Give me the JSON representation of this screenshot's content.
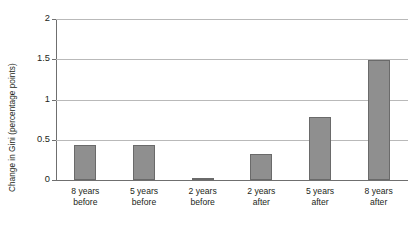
{
  "chart_data": {
    "type": "bar",
    "title": "",
    "xlabel": "",
    "ylabel": "Change in Gini (percentage points)",
    "ylim": [
      0,
      2
    ],
    "yticks": [
      "0",
      "0.5",
      "1",
      "1.5",
      "2"
    ],
    "ytick_values": [
      0,
      0.5,
      1,
      1.5,
      2
    ],
    "grid": true,
    "legend": "none",
    "categories": [
      "8 years before",
      "5 years before",
      "2 years before",
      "2 years after",
      "5 years after",
      "8 years after"
    ],
    "category_lines": [
      {
        "line1": "8 years",
        "line2": "before"
      },
      {
        "line1": "5 years",
        "line2": "before"
      },
      {
        "line1": "2 years",
        "line2": "before"
      },
      {
        "line1": "2 years",
        "line2": "after"
      },
      {
        "line1": "5 years",
        "line2": "after"
      },
      {
        "line1": "8 years",
        "line2": "after"
      }
    ],
    "values": [
      0.44,
      0.44,
      0.03,
      0.32,
      0.78,
      1.49
    ],
    "bar_color": "#8f8f8f",
    "bar_edge_color": "#6a6a6a",
    "grid_color": "#b9b9b9",
    "axis_color": "#6f6f6f",
    "text_color": "#231f20",
    "background": "#ffffff"
  }
}
